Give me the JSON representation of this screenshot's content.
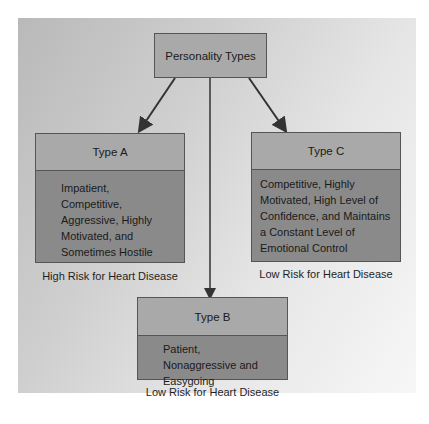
{
  "diagram": {
    "root": {
      "label": "Personality Types"
    },
    "types": [
      {
        "title": "Type A",
        "description": "Impatient, Competitive, Aggressive, Highly Motivated, and Sometimes Hostile",
        "risk": "High Risk for Heart Disease"
      },
      {
        "title": "Type B",
        "description": "Patient, Nonaggressive and Easygoing",
        "risk": "Low Risk for Heart Disease"
      },
      {
        "title": "Type C",
        "description": "Competitive, Highly Motivated, High Level of Confidence, and Maintains a Constant Level of Emotional Control",
        "risk": "Low Risk for Heart Disease"
      }
    ],
    "colors": {
      "header_fill": "#a9a9a9",
      "body_fill": "#8a8a8a",
      "border": "#555555",
      "arrow": "#333333"
    }
  }
}
